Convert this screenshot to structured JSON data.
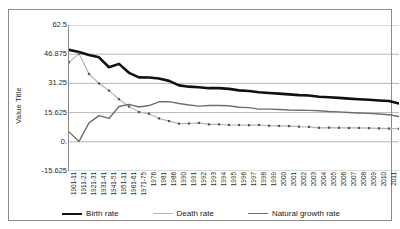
{
  "chart_data": {
    "type": "line",
    "title": "",
    "xlabel": "",
    "ylabel": "Value Title",
    "ylim": [
      -15.625,
      62.5
    ],
    "yticks": [
      "62.5",
      "46.875",
      "31.25",
      "15.625",
      "0.",
      "-15.625"
    ],
    "ytick_values": [
      62.5,
      46.875,
      31.25,
      15.625,
      0,
      -15.625
    ],
    "grid": true,
    "legend_position": "bottom",
    "categories": [
      "1901-11",
      "1911-21",
      "1921-31",
      "1931-41",
      "1941-51",
      "1951-11",
      "1961-61",
      "1971-75",
      "1976",
      "1981",
      "1986",
      "1990",
      "1991",
      "1992",
      "1993",
      "1994",
      "1995",
      "1996",
      "1997",
      "1998",
      "1999",
      "2000",
      "2001",
      "2002",
      "2003",
      "2004",
      "2005",
      "2006",
      "2007",
      "2008",
      "2009",
      "2010",
      "2011",
      "2012"
    ],
    "series": [
      {
        "name": "Birth rate",
        "color": "#111111",
        "style": "solid-thick",
        "values": [
          49.2,
          48.1,
          46.4,
          45.2,
          39.9,
          41.7,
          36.9,
          34.5,
          34.4,
          33.9,
          32.6,
          30.2,
          29.5,
          29.2,
          28.7,
          28.7,
          28.3,
          27.5,
          27.2,
          26.5,
          26.1,
          25.8,
          25.4,
          25.0,
          24.8,
          24.1,
          23.8,
          23.5,
          23.1,
          22.8,
          22.5,
          22.1,
          21.8,
          20.5
        ]
      },
      {
        "name": "Death rate",
        "color": "#b5b5b5",
        "style": "dotted",
        "values": [
          42.6,
          47.2,
          36.3,
          31.2,
          27.4,
          22.8,
          18.9,
          15.9,
          15.0,
          12.5,
          11.1,
          9.7,
          9.8,
          10.1,
          9.3,
          9.3,
          9.0,
          9.0,
          8.9,
          9.0,
          8.6,
          8.5,
          8.4,
          8.1,
          8.0,
          7.5,
          7.6,
          7.5,
          7.4,
          7.4,
          7.3,
          7.2,
          7.1,
          7.0
        ]
      },
      {
        "name": "Natural growth rate",
        "color": "#6e6e6e",
        "style": "solid",
        "values": [
          5.3,
          0.2,
          10.1,
          14.0,
          12.5,
          18.9,
          20.0,
          18.6,
          19.4,
          21.4,
          21.5,
          20.5,
          19.7,
          19.1,
          19.4,
          19.4,
          19.3,
          18.5,
          18.3,
          17.5,
          17.5,
          17.3,
          17.0,
          16.9,
          16.8,
          16.6,
          16.2,
          16.0,
          15.7,
          15.4,
          15.2,
          14.9,
          14.5,
          13.5
        ]
      }
    ]
  },
  "legend": {
    "items": [
      {
        "label": "Birth rate"
      },
      {
        "label": "Death rate"
      },
      {
        "label": "Natural growth rate"
      }
    ]
  }
}
